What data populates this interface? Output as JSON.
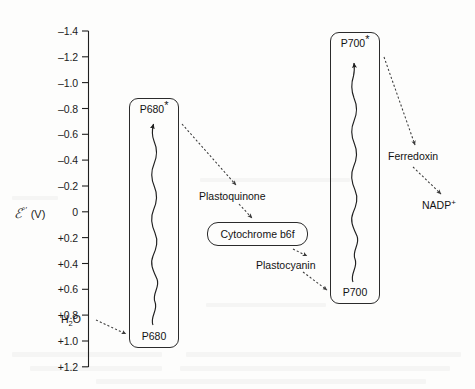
{
  "figure": {
    "type": "z-scheme-photosynthesis-diagram",
    "background_color": "#fdfdfc",
    "ink_color": "#1b1b1b"
  },
  "axis": {
    "title_symbol": "ℰ",
    "title_primes": "°′",
    "title_unit": "(V)",
    "title_full": "ℰ°′ (V)",
    "orientation": "vertical",
    "direction": "negative-up",
    "range_top": -1.4,
    "range_bottom": 1.2,
    "step": 0.2,
    "ticks": [
      {
        "label": "–1.4",
        "value": -1.4
      },
      {
        "label": "–1.2",
        "value": -1.2
      },
      {
        "label": "–1.0",
        "value": -1.0
      },
      {
        "label": "–0.8",
        "value": -0.8
      },
      {
        "label": "–0.6",
        "value": -0.6
      },
      {
        "label": "–0.4",
        "value": -0.4
      },
      {
        "label": "–0.2",
        "value": -0.2
      },
      {
        "label": "0",
        "value": 0.0
      },
      {
        "label": "+0.2",
        "value": 0.2
      },
      {
        "label": "+0.4",
        "value": 0.4
      },
      {
        "label": "+0.6",
        "value": 0.6
      },
      {
        "label": "+0.8",
        "value": 0.8
      },
      {
        "label": "+1.0",
        "value": 1.0
      },
      {
        "label": "+1.2",
        "value": 1.2
      }
    ]
  },
  "photosystems": [
    {
      "id": "psii",
      "box_name": "photosystem-ii-box",
      "ground_label": "P680",
      "excited_label": "P680",
      "excited_star": "*",
      "ground_potential": 1.0,
      "excited_potential": -0.72,
      "excitation": "photon-absorption-wavy-arrow-upward"
    },
    {
      "id": "psi",
      "box_name": "photosystem-i-box",
      "ground_label": "P700",
      "excited_label": "P700",
      "excited_star": "*",
      "ground_potential": 0.82,
      "excited_potential": -1.28,
      "excitation": "photon-absorption-wavy-arrow-upward"
    }
  ],
  "carriers": [
    {
      "id": "water",
      "label": "H",
      "sub": "2",
      "tail": "O",
      "sup": "",
      "potential": 0.82
    },
    {
      "id": "plastoquinone",
      "label": "Plastoquinone",
      "sub": "",
      "tail": "",
      "sup": "",
      "potential": -0.13
    },
    {
      "id": "plastocyanin",
      "label": "Plastocyanin",
      "sub": "",
      "tail": "",
      "sup": "",
      "potential": 0.37
    },
    {
      "id": "ferredoxin",
      "label": "Ferredoxin",
      "sub": "",
      "tail": "",
      "sup": "",
      "potential": -0.43
    },
    {
      "id": "nadp",
      "label": "NADP",
      "sub": "",
      "tail": "",
      "sup": "+",
      "potential": -0.32
    }
  ],
  "complex": {
    "id": "cytochrome-b6f",
    "prefix": "Cytochrome ",
    "italic_b": "b",
    "subscript_6": "6",
    "italic_f": "f",
    "full_label": "Cytochrome b6f",
    "potential": 0.08
  },
  "electron_flow": [
    {
      "from": "H2O",
      "to": "P680",
      "style": "dotted-arrow"
    },
    {
      "from": "P680*",
      "to": "Plastoquinone",
      "style": "dotted-arrow"
    },
    {
      "from": "Plastoquinone",
      "to": "Cytochrome b6f",
      "style": "dotted-arrow"
    },
    {
      "from": "Cytochrome b6f",
      "to": "Plastocyanin",
      "style": "dotted-arrow"
    },
    {
      "from": "Plastocyanin",
      "to": "P700",
      "style": "dotted-arrow"
    },
    {
      "from": "P700*",
      "to": "Ferredoxin",
      "style": "dotted-arrow"
    },
    {
      "from": "Ferredoxin",
      "to": "NADP+",
      "style": "dotted-arrow"
    }
  ]
}
